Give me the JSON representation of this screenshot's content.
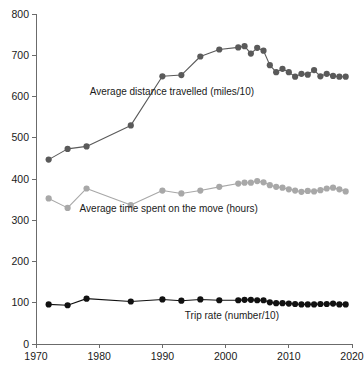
{
  "chart_data": {
    "type": "line",
    "title": "",
    "subtitle": "",
    "xlabel": "",
    "ylabel": "",
    "xlim": [
      1970,
      2020
    ],
    "ylim": [
      0,
      800
    ],
    "xticks": [
      1970,
      1980,
      1990,
      2000,
      2010,
      2020
    ],
    "xtick_labels": [
      "1970",
      "1980",
      "1990",
      "2000",
      "2010",
      "2020"
    ],
    "yticks": [
      0,
      100,
      200,
      300,
      400,
      500,
      600,
      700,
      800
    ],
    "ytick_labels": [
      "0",
      "100",
      "200",
      "300",
      "400",
      "500",
      "600",
      "700",
      "800"
    ],
    "grid": false,
    "legend_position": "inline-annotations",
    "markers": "circle",
    "series": [
      {
        "name": "Average distance travelled (miles/10)",
        "color": "#5a5a5a",
        "label_x": 1991.5,
        "label_y": 613,
        "x": [
          1972,
          1975,
          1978,
          1985,
          1990,
          1993,
          1996,
          1999,
          2002,
          2003,
          2004,
          2005,
          2006,
          2007,
          2008,
          2009,
          2010,
          2011,
          2012,
          2013,
          2014,
          2015,
          2016,
          2017,
          2018,
          2019
        ],
        "values": [
          447,
          473,
          479,
          530,
          649,
          652,
          697,
          714,
          719,
          722,
          704,
          718,
          711,
          676,
          659,
          667,
          659,
          648,
          655,
          653,
          664,
          649,
          655,
          650,
          648,
          648
        ]
      },
      {
        "name": "Average time spent on the move (hours)",
        "color": "#a8a8a8",
        "label_x": 1991.0,
        "label_y": 329,
        "x": [
          1972,
          1975,
          1978,
          1985,
          1990,
          1993,
          1996,
          1999,
          2002,
          2003,
          2004,
          2005,
          2006,
          2007,
          2008,
          2009,
          2010,
          2011,
          2012,
          2013,
          2014,
          2015,
          2016,
          2017,
          2018,
          2019
        ],
        "values": [
          353,
          330,
          377,
          337,
          372,
          365,
          372,
          381,
          389,
          391,
          391,
          395,
          392,
          385,
          381,
          379,
          375,
          372,
          369,
          371,
          370,
          373,
          377,
          379,
          375,
          370
        ]
      },
      {
        "name": "Trip rate (number/10)",
        "color": "#111111",
        "label_x": 2001.0,
        "label_y": 70,
        "x": [
          1972,
          1975,
          1978,
          1985,
          1990,
          1993,
          1996,
          1999,
          2002,
          2003,
          2004,
          2005,
          2006,
          2007,
          2008,
          2009,
          2010,
          2011,
          2012,
          2013,
          2014,
          2015,
          2016,
          2017,
          2018,
          2019
        ],
        "values": [
          96,
          94,
          110,
          103,
          108,
          105,
          108,
          106,
          106,
          107,
          107,
          106,
          106,
          101,
          99,
          99,
          98,
          97,
          96,
          96,
          96,
          97,
          97,
          98,
          96,
          96
        ]
      }
    ]
  }
}
